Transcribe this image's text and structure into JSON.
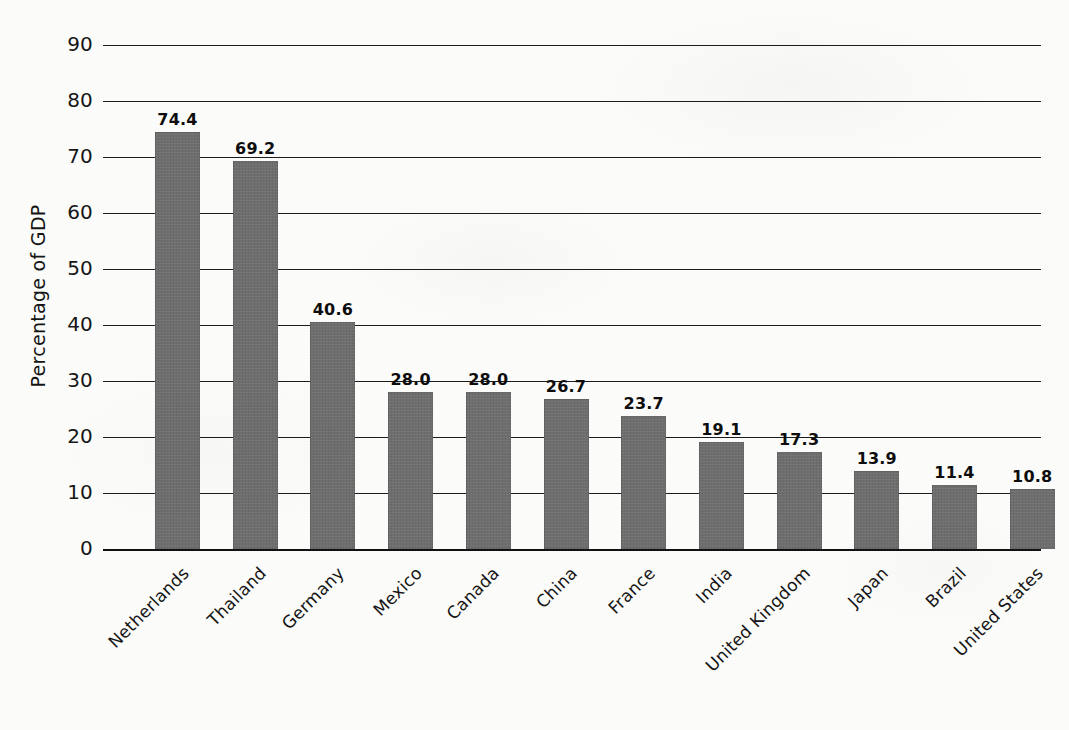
{
  "chart_data": {
    "type": "bar",
    "title": "",
    "subtitle": "",
    "xlabel": "",
    "ylabel": "Percentage of GDP",
    "ylim": [
      0,
      90
    ],
    "ytick_step": 10,
    "yticks": [
      "90",
      "80",
      "70",
      "60",
      "50",
      "40",
      "30",
      "20",
      "10",
      "0"
    ],
    "ytick_values": [
      90,
      80,
      70,
      60,
      50,
      40,
      30,
      20,
      10,
      0
    ],
    "grid": "horizontal",
    "legend": "none",
    "orientation": "vertical",
    "bar_color": "#6e6e6e",
    "background_color": "#fbfbf9",
    "categories": [
      "Netherlands",
      "Thailand",
      "Germany",
      "Mexico",
      "Canada",
      "China",
      "France",
      "India",
      "United Kingdom",
      "Japan",
      "Brazil",
      "United States"
    ],
    "values": [
      74.4,
      69.2,
      40.6,
      28.0,
      28.0,
      26.7,
      23.7,
      19.1,
      17.3,
      13.9,
      11.4,
      10.8
    ],
    "value_labels": [
      "74.4",
      "69.2",
      "40.6",
      "28.0",
      "28.0",
      "26.7",
      "23.7",
      "19.1",
      "17.3",
      "13.9",
      "11.4",
      "10.8"
    ]
  }
}
